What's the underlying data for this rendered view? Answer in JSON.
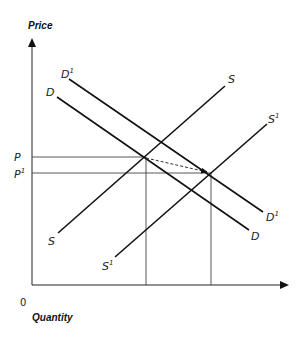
{
  "diagram": {
    "y_axis_title": "Price",
    "x_axis_title": "Quantity",
    "origin_label": "0",
    "price_labels": {
      "p": "P",
      "p1_base": "P",
      "p1_sup": "1"
    },
    "curves": {
      "S": {
        "label": "S",
        "lower_label": "S"
      },
      "S1": {
        "label_base": "S",
        "label_sup": "1"
      },
      "D": {
        "label": "D"
      },
      "D1": {
        "label_base": "D",
        "label_sup": "1"
      }
    },
    "colors": {
      "line": "#111111",
      "guide": "#444444",
      "background": "#ffffff"
    }
  }
}
